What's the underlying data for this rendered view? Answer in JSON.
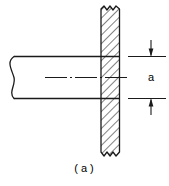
{
  "figure": {
    "caption": "( a )",
    "dimension_label": "a",
    "colors": {
      "line": "#1a1a1a",
      "hatch": "#1a1a1a",
      "background": "#ffffff"
    },
    "parts": [
      {
        "name": "round-bar",
        "description": "Horizontal cylindrical bar shown with break line at left end",
        "label": ""
      },
      {
        "name": "plate",
        "description": "Vertical plate shown in section with 45 degree hatching",
        "label": ""
      },
      {
        "name": "center-line",
        "description": "Dash-dot axis of the bar",
        "label": ""
      }
    ],
    "dimension": {
      "name": "a",
      "label": "a",
      "orientation": "vertical",
      "arrow_style": "outside-pointing-in"
    }
  }
}
